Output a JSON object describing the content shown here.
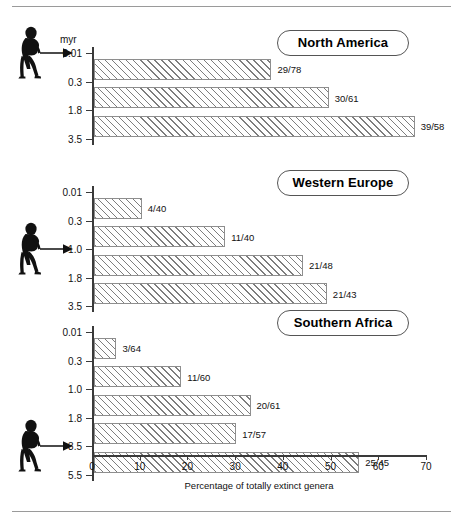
{
  "figure": {
    "y_unit_label": "myr",
    "x_axis_caption": "Percentage of totally extinct genera",
    "marker_icon": "walking-hominid-icon",
    "arrow_icon": "right-arrow-icon"
  },
  "chart_data": {
    "type": "bar",
    "orientation": "horizontal",
    "title": "",
    "xlabel": "Percentage of totally extinct genera",
    "ylabel": "myr",
    "xlim": [
      0,
      70
    ],
    "xticks": [
      0,
      10,
      20,
      30,
      40,
      50,
      60,
      70
    ],
    "grid": false,
    "legend": "none",
    "panels": [
      {
        "name": "North America",
        "yticks": [
          "0.01",
          "0.3",
          "1.8",
          "3.5"
        ],
        "arrival_tick": "0.01",
        "bars": [
          {
            "interval": "0.01-0.3",
            "label": "29/78",
            "extinct": 29,
            "total": 78,
            "value": 37.2
          },
          {
            "interval": "0.3-1.8",
            "label": "30/61",
            "extinct": 30,
            "total": 61,
            "value": 49.2
          },
          {
            "interval": "1.8-3.5",
            "label": "39/58",
            "extinct": 39,
            "total": 58,
            "value": 67.2
          }
        ]
      },
      {
        "name": "Western Europe",
        "yticks": [
          "0.01",
          "0.3",
          "1.0",
          "1.8",
          "3.5"
        ],
        "arrival_tick": "1.0",
        "bars": [
          {
            "interval": "0.01-0.3",
            "label": "4/40",
            "extinct": 4,
            "total": 40,
            "value": 10.0
          },
          {
            "interval": "0.3-1.0",
            "label": "11/40",
            "extinct": 11,
            "total": 40,
            "value": 27.5
          },
          {
            "interval": "1.0-1.8",
            "label": "21/48",
            "extinct": 21,
            "total": 48,
            "value": 43.8
          },
          {
            "interval": "1.8-3.5",
            "label": "21/43",
            "extinct": 21,
            "total": 43,
            "value": 48.8
          }
        ]
      },
      {
        "name": "Southern Africa",
        "yticks": [
          "0.01",
          "0.3",
          "1.0",
          "1.8",
          "3.5",
          "5.5"
        ],
        "arrival_tick": "3.5",
        "bars": [
          {
            "interval": "0.01-0.3",
            "label": "3/64",
            "extinct": 3,
            "total": 64,
            "value": 4.7
          },
          {
            "interval": "0.3-1.0",
            "label": "11/60",
            "extinct": 11,
            "total": 60,
            "value": 18.3
          },
          {
            "interval": "1.0-1.8",
            "label": "20/61",
            "extinct": 20,
            "total": 61,
            "value": 32.8
          },
          {
            "interval": "1.8-3.5",
            "label": "17/57",
            "extinct": 17,
            "total": 57,
            "value": 29.8
          },
          {
            "interval": "3.5-5.5",
            "label": "25/45",
            "extinct": 25,
            "total": 45,
            "value": 55.6
          }
        ]
      }
    ]
  },
  "colors": {
    "axis": "#3a3a3a",
    "bar_border": "#8e8e8e",
    "hatch": "#7d7d7d",
    "text": "#111111",
    "rule": "#9a9a9a"
  }
}
